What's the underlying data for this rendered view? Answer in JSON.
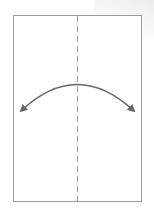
{
  "diagram": {
    "type": "origami-fold-step",
    "paper": {
      "x": 13,
      "y": 15,
      "width": 129,
      "height": 187,
      "stroke": "#9a9a9a",
      "fill": "#ffffff"
    },
    "fold_line": {
      "style": "dashed",
      "x": 77,
      "y1": 15,
      "y2": 202,
      "color": "#9a9a9a"
    },
    "arrow": {
      "style": "double-headed-arc",
      "from": [
        20,
        112
      ],
      "apex": [
        77,
        84
      ],
      "to": [
        135,
        112
      ],
      "color": "#666666"
    }
  }
}
